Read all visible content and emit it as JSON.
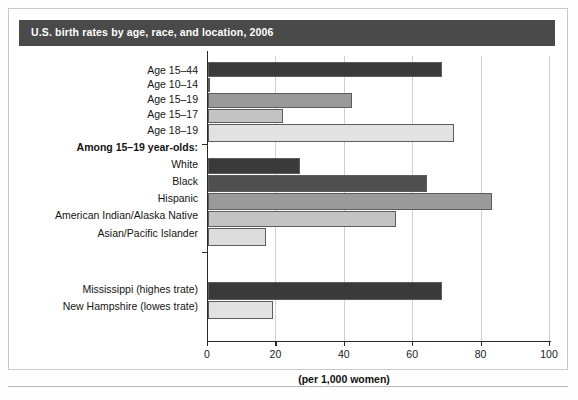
{
  "title": "U.S. birth rates by age, race, and location, 2006",
  "axis": {
    "xlabel": "(per 1,000 women)",
    "ticks": [
      "0",
      "20",
      "40",
      "60",
      "80",
      "100"
    ]
  },
  "group_headers": {
    "among_teens": "Among 15–19 year-olds:"
  },
  "chart_data": {
    "type": "bar",
    "orientation": "horizontal",
    "title": "U.S. birth rates by age, race, and location, 2006",
    "xlabel": "(per 1,000 women)",
    "ylabel": "",
    "xlim": [
      0,
      100
    ],
    "xticks": [
      0,
      20,
      40,
      60,
      80,
      100
    ],
    "grid": true,
    "legend": "none",
    "categories": [
      "Age 15–44",
      "Age 10–14",
      "Age 15–19",
      "Age 15–17",
      "Age 18–19",
      "White",
      "Black",
      "Hispanic",
      "American Indian/Alaska Native",
      "Asian/Pacific Islander",
      "Mississippi (highes trate)",
      "New Hampshire (lowes trate)"
    ],
    "values": [
      68.5,
      0.6,
      42,
      22,
      72,
      27,
      64,
      83,
      55,
      17,
      68.5,
      19
    ],
    "colors": [
      "#3a3a3a",
      "#ffffff",
      "#9a9a9a",
      "#c3c3c3",
      "#e2e2e2",
      "#3a3a3a",
      "#4f4f4f",
      "#9a9a9a",
      "#c3c3c3",
      "#dcdcdc",
      "#3a3a3a",
      "#e2e2e2"
    ],
    "group_separators": [
      "Among 15–19 year-olds:"
    ]
  },
  "bars": [
    {
      "label": "Age 15–44",
      "value": 68.5,
      "color": "#3a3a3a",
      "y": 6,
      "h": 15
    },
    {
      "label": "Age 10–14",
      "value": 0.6,
      "color": "#ffffff",
      "y": 22,
      "h": 14
    },
    {
      "label": "Age 15–19",
      "value": 42,
      "color": "#9a9a9a",
      "y": 37,
      "h": 15
    },
    {
      "label": "Age 15–17",
      "value": 22,
      "color": "#c3c3c3",
      "y": 53,
      "h": 14
    },
    {
      "label": "Age 18–19",
      "value": 72,
      "color": "#e2e2e2",
      "y": 68,
      "h": 18
    },
    {
      "label": "White",
      "value": 27,
      "color": "#3a3a3a",
      "y": 102,
      "h": 16
    },
    {
      "label": "Black",
      "value": 64,
      "color": "#4f4f4f",
      "y": 119,
      "h": 17
    },
    {
      "label": "Hispanic",
      "value": 83,
      "color": "#9a9a9a",
      "y": 137,
      "h": 17
    },
    {
      "label": "American Indian/Alaska Native",
      "value": 55,
      "color": "#c3c3c3",
      "y": 155,
      "h": 16
    },
    {
      "label": "Asian/Pacific Islander",
      "value": 17,
      "color": "#dcdcdc",
      "y": 172,
      "h": 18
    },
    {
      "label": "Mississippi (highes trate)",
      "value": 68.5,
      "color": "#3a3a3a",
      "y": 226,
      "h": 18
    },
    {
      "label": "New Hampshire (lowes trate)",
      "value": 19,
      "color": "#e2e2e2",
      "y": 245,
      "h": 18
    }
  ],
  "row_labels": [
    {
      "text": "Age 15–44",
      "top": 8,
      "bold": false
    },
    {
      "text": "Age 10–14",
      "top": 22,
      "bold": false
    },
    {
      "text": "Age 15–19",
      "top": 37,
      "bold": false
    },
    {
      "text": "Age 15–17",
      "top": 52,
      "bold": false
    },
    {
      "text": "Age 18–19",
      "top": 68,
      "bold": false
    },
    {
      "text": "Among 15–19 year-olds:",
      "top": 85,
      "bold": true
    },
    {
      "text": "White",
      "top": 102,
      "bold": false
    },
    {
      "text": "Black",
      "top": 119,
      "bold": false
    },
    {
      "text": "Hispanic",
      "top": 136,
      "bold": false
    },
    {
      "text": "American Indian/Alaska Native",
      "top": 153,
      "bold": false
    },
    {
      "text": "Asian/Pacific Islander",
      "top": 171,
      "bold": false
    },
    {
      "text": "Mississippi (highes trate)",
      "top": 227,
      "bold": false
    },
    {
      "text": "New Hampshire (lowes trate)",
      "top": 244,
      "bold": false
    }
  ]
}
